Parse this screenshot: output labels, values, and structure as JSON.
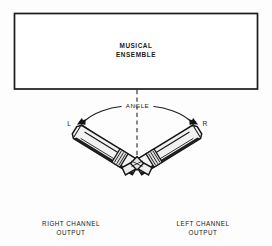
{
  "figure": {
    "background_color": "#fdfdfd",
    "ink_color": "#1a1a1a"
  },
  "ensemble_box": {
    "line1": "MUSICAL",
    "line2": "ENSEMBLE",
    "border_color": "#1a1a1a"
  },
  "centerline": {
    "style": "dashed",
    "color": "#4a4a4a"
  },
  "angle": {
    "label": "ANGLE",
    "arc_color": "#1f1f1f",
    "left_arrow_label": "L",
    "right_arrow_label": "R"
  },
  "microphones": {
    "left": {
      "channel_label_line1": "RIGHT CHANNEL",
      "channel_label_line2": "OUTPUT",
      "body_color": "#f2f2f2",
      "outline_color": "#161616"
    },
    "right": {
      "channel_label_line1": "LEFT CHANNEL",
      "channel_label_line2": "OUTPUT",
      "body_color": "#f2f2f2",
      "outline_color": "#161616"
    },
    "mount_color": "#ededed"
  }
}
